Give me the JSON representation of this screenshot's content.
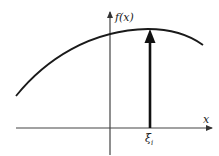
{
  "diagram": {
    "y_axis_label": "f(x)",
    "x_axis_label": "x",
    "point_label_main": "ξ",
    "point_label_sub": "i",
    "colors": {
      "ink": "#1a1a1a",
      "axis": "#333333",
      "background": "#ffffff"
    }
  }
}
